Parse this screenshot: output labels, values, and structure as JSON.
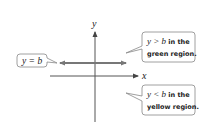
{
  "diagram": {
    "axes": {
      "x_label": "x",
      "y_label": "y"
    },
    "line": {
      "label": "y = b"
    },
    "callouts": {
      "above": {
        "line1_math": "y > b",
        "line1_text": " in the",
        "line2_text": "green region."
      },
      "below": {
        "line1_math": "y < b",
        "line1_text": " in the",
        "line2_text": "yellow region."
      }
    },
    "colors": {
      "axis": "#444444",
      "line": "#777777",
      "callout_border": "#888888",
      "callout_fill": "#ffffff"
    }
  }
}
